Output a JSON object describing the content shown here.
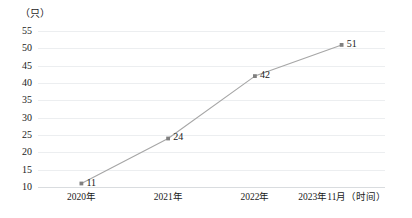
{
  "chart_data": {
    "type": "line",
    "title": "",
    "subtitle": "",
    "xlabel": "（时间）",
    "ylabel": "（只）",
    "categories": [
      "2020年",
      "2021年",
      "2022年",
      "2023年11月"
    ],
    "x_tick_labels": [
      "2020年",
      "2021年",
      "2022年",
      "2023年11月（时间）"
    ],
    "values": [
      11,
      24,
      42,
      51
    ],
    "point_labels": [
      "11",
      "24",
      "42",
      "51"
    ],
    "y_ticks": [
      10,
      15,
      20,
      25,
      30,
      35,
      40,
      45,
      50,
      55
    ],
    "y_tick_labels": [
      "10",
      "15",
      "20",
      "25",
      "30",
      "35",
      "40",
      "45",
      "50",
      "55"
    ],
    "ylim": [
      10,
      55
    ],
    "grid": true,
    "legend": false,
    "legend_position": "none",
    "series": [
      {
        "name": "数量",
        "values": [
          11,
          24,
          42,
          51
        ]
      }
    ],
    "colors": {
      "line": "#a6a6a6",
      "marker": "#808080",
      "gridline": "#eceef0",
      "axis": "#d9dcdf",
      "text": "#1a1a1a",
      "background": "#ffffff"
    }
  },
  "axis": {
    "y_unit_caption": "（只）"
  }
}
